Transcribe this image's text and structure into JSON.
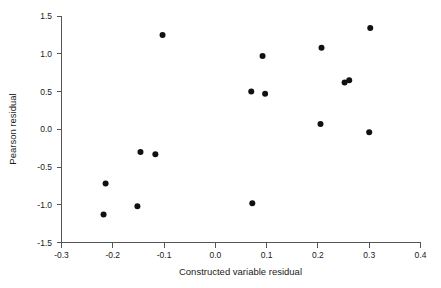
{
  "chart_data": {
    "type": "scatter",
    "title": "",
    "xlabel": "Constructed variable residual",
    "ylabel": "Pearson residual",
    "xlim": [
      -0.3,
      0.4
    ],
    "ylim": [
      -1.5,
      1.5
    ],
    "grid": false,
    "legend": null,
    "marker": {
      "shape": "circle",
      "color": "#111111",
      "size": 3
    },
    "xticks": [
      -0.3,
      -0.2,
      -0.1,
      0.0,
      0.1,
      0.2,
      0.3,
      0.4
    ],
    "xtick_labels": [
      "-0.3",
      "-0.2",
      "-0.1",
      "0.0",
      "0.1",
      "0.2",
      "0.3",
      "0.4"
    ],
    "yticks": [
      -1.5,
      -1.0,
      -0.5,
      0.0,
      0.5,
      1.0,
      1.5
    ],
    "ytick_labels": [
      "-1.5",
      "-1.0",
      "-0.5",
      "0.0",
      "0.5",
      "1.0",
      "1.5"
    ],
    "points": [
      {
        "x": -0.218,
        "y": -1.13
      },
      {
        "x": -0.214,
        "y": -0.72
      },
      {
        "x": -0.152,
        "y": -1.02
      },
      {
        "x": -0.146,
        "y": -0.3
      },
      {
        "x": -0.117,
        "y": -0.33
      },
      {
        "x": -0.103,
        "y": 1.25
      },
      {
        "x": 0.07,
        "y": 0.5
      },
      {
        "x": 0.072,
        "y": -0.98
      },
      {
        "x": 0.092,
        "y": 0.97
      },
      {
        "x": 0.097,
        "y": 0.47
      },
      {
        "x": 0.205,
        "y": 0.07
      },
      {
        "x": 0.207,
        "y": 1.08
      },
      {
        "x": 0.252,
        "y": 0.62
      },
      {
        "x": 0.261,
        "y": 0.65
      },
      {
        "x": 0.3,
        "y": -0.04
      },
      {
        "x": 0.302,
        "y": 1.34
      }
    ],
    "x_values": [
      -0.218,
      -0.214,
      -0.152,
      -0.146,
      -0.117,
      -0.103,
      0.07,
      0.072,
      0.092,
      0.097,
      0.205,
      0.207,
      0.252,
      0.261,
      0.3,
      0.302
    ],
    "y_values": [
      -1.13,
      -0.72,
      -1.02,
      -0.3,
      -0.33,
      1.25,
      0.5,
      -0.98,
      0.97,
      0.47,
      0.07,
      1.08,
      0.62,
      0.65,
      -0.04,
      1.34
    ]
  },
  "axes": {
    "x_title": "Constructed variable residual",
    "y_title": "Pearson residual"
  }
}
